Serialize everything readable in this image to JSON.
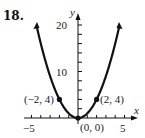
{
  "problem_number": "18.",
  "chart_data": {
    "type": "line",
    "title": "",
    "xlabel": "x",
    "ylabel": "y",
    "xlim": [
      -5,
      5
    ],
    "ylim": [
      0,
      20
    ],
    "x_ticks_labeled": [
      -5,
      5
    ],
    "y_ticks_labeled": [
      10,
      20
    ],
    "x_minor_step": 1,
    "y_minor_step": 2,
    "grid": false,
    "series": [
      {
        "name": "y = x^2",
        "x": [
          -4.5,
          -4,
          -3,
          -2,
          -1,
          0,
          1,
          2,
          3,
          4,
          4.5
        ],
        "y": [
          20.25,
          16,
          9,
          4,
          1,
          0,
          1,
          4,
          9,
          16,
          20.25
        ]
      }
    ],
    "points": [
      {
        "label": "(−2, 4)",
        "x": -2,
        "y": 4
      },
      {
        "label": "(0, 0)",
        "x": 0,
        "y": 0
      },
      {
        "label": "(2, 4)",
        "x": 2,
        "y": 4
      }
    ],
    "tick_labels": {
      "x_neg": "−5",
      "x_pos": "5",
      "y_mid": "10",
      "y_top": "20"
    }
  }
}
